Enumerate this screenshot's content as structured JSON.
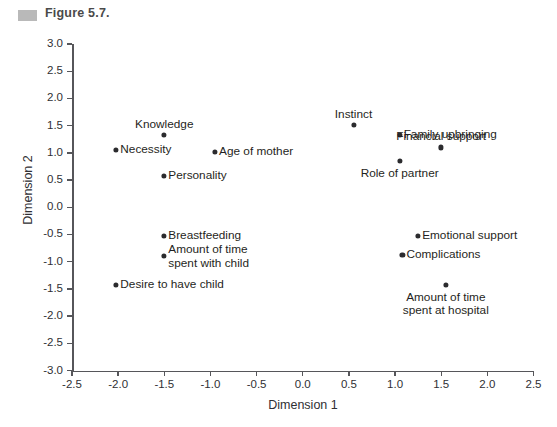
{
  "figure": {
    "caption": "Figure 5.7.",
    "swatch_color": "#b9b9b9"
  },
  "chart_data": {
    "type": "scatter",
    "title": "",
    "xlabel": "Dimension 1",
    "ylabel": "Dimension 2",
    "xlim": [
      -2.5,
      2.5
    ],
    "ylim": [
      -3.0,
      3.0
    ],
    "grid": false,
    "legend": null,
    "point_color": "#2b2b2e",
    "xticks": [
      "-2.5",
      "-2.0",
      "-1.5",
      "-1.0",
      "-0.5",
      "0.0",
      "0.5",
      "1.0",
      "1.5",
      "2.0",
      "2.5"
    ],
    "xtick_values": [
      -2.5,
      -2.0,
      -1.5,
      -1.0,
      -0.5,
      0.0,
      0.5,
      1.0,
      1.5,
      2.0,
      2.5
    ],
    "yticks": [
      "3.0",
      "2.5",
      "2.0",
      "1.5",
      "1.0",
      "0.5",
      "0.0",
      "-0.5",
      "-1.0",
      "-1.5",
      "-2.0",
      "-2.5",
      "-3.0"
    ],
    "ytick_values": [
      3.0,
      2.5,
      2.0,
      1.5,
      1.0,
      0.5,
      0.0,
      -0.5,
      -1.0,
      -1.5,
      -2.0,
      -2.5,
      -3.0
    ],
    "points": [
      {
        "label": "Knowledge",
        "x": -1.5,
        "y": 1.33,
        "label_pos": "above"
      },
      {
        "label": "Necessity",
        "x": -2.02,
        "y": 1.05,
        "label_pos": "right"
      },
      {
        "label": "Age of mother",
        "x": -0.95,
        "y": 1.02,
        "label_pos": "right"
      },
      {
        "label": "Personality",
        "x": -1.5,
        "y": 0.58,
        "label_pos": "right"
      },
      {
        "label": "Breastfeeding",
        "x": -1.5,
        "y": -0.52,
        "label_pos": "right"
      },
      {
        "label": "Amount of time\nspent with child",
        "x": -1.5,
        "y": -0.9,
        "label_pos": "right"
      },
      {
        "label": "Desire to have child",
        "x": -2.02,
        "y": -1.42,
        "label_pos": "right"
      },
      {
        "label": "Instinct",
        "x": 0.55,
        "y": 1.52,
        "label_pos": "above"
      },
      {
        "label": "Family upbringing",
        "x": 1.05,
        "y": 1.33,
        "label_pos": "right"
      },
      {
        "label": "Financial support",
        "x": 1.5,
        "y": 1.1,
        "label_pos": "above"
      },
      {
        "label": "Role of partner",
        "x": 1.05,
        "y": 0.85,
        "label_pos": "below"
      },
      {
        "label": "Emotional support",
        "x": 1.25,
        "y": -0.52,
        "label_pos": "right"
      },
      {
        "label": "Complications",
        "x": 1.08,
        "y": -0.88,
        "label_pos": "right"
      },
      {
        "label": "Amount of time\nspent at hospital",
        "x": 1.55,
        "y": -1.42,
        "label_pos": "below"
      }
    ]
  }
}
